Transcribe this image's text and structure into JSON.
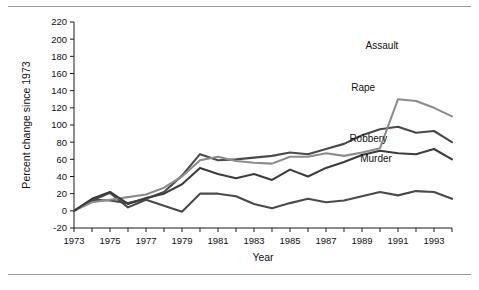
{
  "figure": {
    "has_top_rule": true,
    "has_bottom_rule": true,
    "background": "#ffffff"
  },
  "chart_data": {
    "type": "line",
    "title": "",
    "subtitle": "",
    "xlabel": "Year",
    "ylabel": "Percent change since 1973",
    "xlim": [
      1973,
      1994
    ],
    "ylim": [
      -20,
      220
    ],
    "ytick_step": 20,
    "grid": false,
    "legend_position": "inline-annotations",
    "x": [
      1973,
      1974,
      1975,
      1976,
      1977,
      1978,
      1979,
      1980,
      1981,
      1982,
      1983,
      1984,
      1985,
      1986,
      1987,
      1988,
      1989,
      1990,
      1991,
      1992,
      1993,
      1994
    ],
    "xtick_labels": [
      "1973",
      "1975",
      "1977",
      "1979",
      "1981",
      "1983",
      "1985",
      "1987",
      "1989",
      "1991",
      "1993"
    ],
    "ytick_labels": [
      "-20",
      "0",
      "20",
      "40",
      "60",
      "80",
      "100",
      "120",
      "140",
      "160",
      "180",
      "200",
      "220"
    ],
    "series": [
      {
        "name": "Assault",
        "color": "#3d3d3d",
        "label_x": 1989.2,
        "label_y": 188,
        "values": [
          0,
          14,
          22,
          8,
          15,
          20,
          31,
          50,
          43,
          38,
          43,
          36,
          48,
          40,
          50,
          57,
          65,
          70,
          67,
          66,
          72,
          60
        ]
      },
      {
        "name": "Rape",
        "color": "#8c8c8c",
        "label_x": 1988.4,
        "label_y": 140,
        "values": [
          0,
          10,
          13,
          16,
          19,
          27,
          40,
          59,
          63,
          58,
          56,
          55,
          63,
          63,
          67,
          64,
          68,
          73,
          130,
          128,
          120,
          110
        ]
      },
      {
        "name": "Robbery",
        "color": "#4a4a4a",
        "label_x": 1988.3,
        "label_y": 80,
        "values": [
          0,
          12,
          21,
          4,
          13,
          6,
          -1,
          20,
          20,
          17,
          8,
          3,
          9,
          14,
          10,
          12,
          17,
          22,
          18,
          23,
          22,
          14
        ]
      },
      {
        "name": "Murder",
        "color": "#4a4a4a",
        "label_x": 1988.9,
        "label_y": 57,
        "values": [
          0,
          13,
          12,
          9,
          14,
          22,
          41,
          66,
          59,
          60,
          62,
          64,
          68,
          66,
          72,
          78,
          88,
          95,
          98,
          91,
          93,
          80
        ]
      }
    ],
    "series_render_order": [
      "Murder",
      "Robbery",
      "Rape",
      "Assault"
    ]
  }
}
